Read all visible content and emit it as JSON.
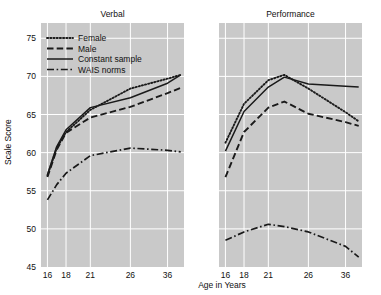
{
  "figure": {
    "background": "#ffffff",
    "plot_background": "#c9c9c9",
    "grid_color": "#ffffff",
    "line_color": "#1a1a1a",
    "xlabel": "Age in Years",
    "ylabel": "Scale Score"
  },
  "legend": {
    "position": "upper-left-of-verbal-panel",
    "entries": [
      {
        "label": "Female",
        "style": "dotted"
      },
      {
        "label": "Male",
        "style": "dashed"
      },
      {
        "label": "Constant sample",
        "style": "solid"
      },
      {
        "label": "WAIS norms",
        "style": "dashdot"
      }
    ]
  },
  "chart_data": [
    {
      "type": "line",
      "title": "Verbal",
      "xlabel": "Age in Years",
      "ylabel": "Scale Score",
      "xscale": "log-like-ordinal",
      "xlim": [
        15.2,
        41.0
      ],
      "ylim": [
        45,
        77
      ],
      "xticks": [
        16,
        18,
        21,
        26,
        36
      ],
      "xticklabels": [
        "16",
        "18",
        "21",
        "26",
        "36"
      ],
      "yticks": [
        45,
        50,
        55,
        60,
        65,
        70,
        75
      ],
      "yticklabels": [
        "45",
        "50",
        "55",
        "60",
        "65",
        "70",
        "75"
      ],
      "grid": true,
      "legend": true,
      "series": [
        {
          "name": "Female",
          "style": "dotted",
          "x": [
            16,
            17,
            18,
            21,
            26,
            36,
            40
          ],
          "y": [
            57.0,
            60.6,
            62.7,
            65.6,
            68.4,
            69.7,
            70.2
          ]
        },
        {
          "name": "Male",
          "style": "dashed",
          "x": [
            16,
            17,
            18,
            21,
            26,
            36,
            40
          ],
          "y": [
            56.8,
            60.4,
            62.6,
            64.6,
            66.0,
            67.8,
            68.5
          ]
        },
        {
          "name": "Constant sample",
          "style": "solid",
          "x": [
            16,
            17,
            18,
            21,
            26,
            36,
            40
          ],
          "y": [
            57.1,
            60.8,
            63.0,
            65.9,
            67.2,
            69.1,
            70.2
          ]
        },
        {
          "name": "WAIS norms",
          "style": "dashdot",
          "x": [
            16,
            17,
            18,
            21,
            26,
            36,
            40
          ],
          "y": [
            53.8,
            55.8,
            57.3,
            59.6,
            60.6,
            60.3,
            60.1
          ]
        }
      ]
    },
    {
      "type": "line",
      "title": "Performance",
      "xlabel": "Age in Years",
      "ylabel": "Scale Score",
      "xscale": "log-like-ordinal",
      "xlim": [
        15.2,
        41.0
      ],
      "ylim": [
        45,
        77
      ],
      "xticks": [
        16,
        18,
        21,
        26,
        36
      ],
      "xticklabels": [
        "16",
        "18",
        "21",
        "26",
        "36"
      ],
      "yticks": [
        45,
        50,
        55,
        60,
        65,
        70,
        75
      ],
      "yticklabels": [
        "45",
        "50",
        "55",
        "60",
        "65",
        "70",
        "75"
      ],
      "grid": true,
      "legend": false,
      "series": [
        {
          "name": "Female",
          "style": "dotted",
          "x": [
            16,
            18,
            21,
            23,
            26,
            36,
            40
          ],
          "y": [
            61.3,
            66.4,
            69.5,
            70.2,
            68.4,
            65.3,
            64.1
          ]
        },
        {
          "name": "Male",
          "style": "dashed",
          "x": [
            16,
            18,
            21,
            23,
            26,
            36,
            40
          ],
          "y": [
            56.8,
            62.7,
            65.9,
            66.7,
            65.1,
            64.0,
            63.5
          ]
        },
        {
          "name": "Constant sample",
          "style": "solid",
          "x": [
            16,
            18,
            21,
            23,
            26,
            36,
            40
          ],
          "y": [
            60.2,
            65.4,
            68.6,
            69.9,
            69.0,
            68.7,
            68.6
          ]
        },
        {
          "name": "WAIS norms",
          "style": "dashdot",
          "x": [
            16,
            18,
            21,
            23,
            26,
            36,
            40
          ],
          "y": [
            48.5,
            49.6,
            50.6,
            50.3,
            49.6,
            47.7,
            46.3
          ]
        }
      ]
    }
  ]
}
